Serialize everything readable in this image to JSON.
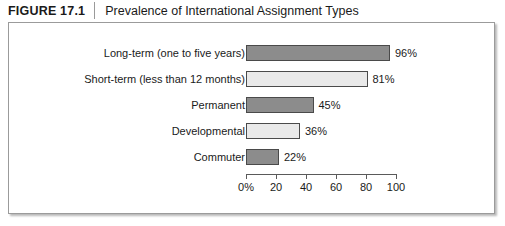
{
  "header": {
    "figure_number": "FIGURE 17.1",
    "title": "Prevalence of International Assignment Types"
  },
  "chart_data": {
    "type": "bar",
    "orientation": "horizontal",
    "title": "Prevalence of International Assignment Types",
    "xlabel": "",
    "ylabel": "",
    "xlim": [
      0,
      110
    ],
    "grid": false,
    "legend": false,
    "categories": [
      "Long-term (one to five years)",
      "Short-term (less than 12 months)",
      "Permanent",
      "Developmental",
      "Commuter"
    ],
    "values": [
      96,
      81,
      45,
      36,
      22
    ],
    "value_labels": [
      "96%",
      "81%",
      "45%",
      "36%",
      "22%"
    ],
    "bar_styles": [
      "dark",
      "light",
      "dark",
      "light",
      "dark"
    ],
    "tick_values": [
      0,
      20,
      40,
      60,
      80,
      100
    ],
    "tick_labels": [
      "0%",
      "20",
      "40",
      "60",
      "80",
      "100"
    ],
    "colors": {
      "bar_dark": "#8c8c8c",
      "bar_light": "#e9e9e9",
      "bar_border": "#4a4a4a",
      "axis": "#5a5a5a",
      "panel_border": "#9b9b9b",
      "text": "#1a1a1a"
    }
  }
}
